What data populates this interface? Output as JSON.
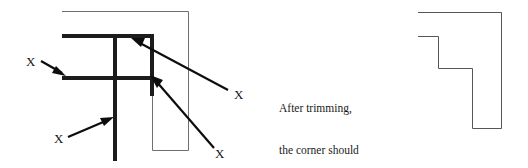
{
  "figure": {
    "title_text_block": {
      "lines": [
        "After trimming,",
        "the corner should",
        "look like this"
      ]
    },
    "left_diagram": {
      "name": "untrimmed-corner-joint",
      "labels": [
        {
          "id": "x-top-left",
          "text": "X"
        },
        {
          "id": "x-bottom-left",
          "text": "X"
        },
        {
          "id": "x-top-right",
          "text": "X"
        },
        {
          "id": "x-bottom-right",
          "text": "X"
        }
      ]
    },
    "right_diagram": {
      "name": "trimmed-corner-result"
    },
    "colors": {
      "background": "#ffffff",
      "thick_stroke": "#1c1c1c",
      "thin_stroke": "#6f6f6f",
      "leader_stroke": "#0d0d0d",
      "text": "#1a1a1a"
    }
  }
}
